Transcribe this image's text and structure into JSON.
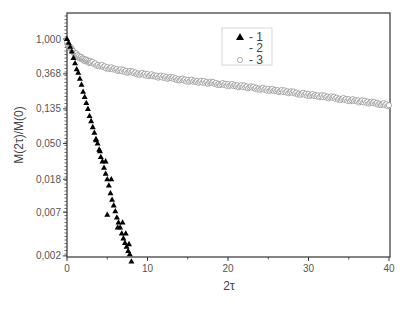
{
  "chart_data": {
    "type": "scatter",
    "title": "",
    "xlabel": "2τ",
    "ylabel": "M(2τ)/M(0)",
    "xlim": [
      0,
      40
    ],
    "ylim": [
      0.0015,
      1.6
    ],
    "yscale": "log",
    "grid": false,
    "legend_position": "upper center",
    "x_ticks": [
      0,
      10,
      20,
      30,
      40
    ],
    "y_ticks": [
      1.0,
      0.368,
      0.135,
      0.05,
      0.018,
      0.007,
      0.002
    ],
    "y_tick_labels": [
      "1,000",
      "0,368",
      "0,135",
      "0,050",
      "0,018",
      "0,007",
      "0,002"
    ],
    "x_tick_labels": [
      "0",
      "10",
      "20",
      "30",
      "40"
    ],
    "legend": [
      {
        "label": "- 1",
        "marker": "filled-triangle"
      },
      {
        "label": "- 2",
        "marker": "none"
      },
      {
        "label": "- 3",
        "marker": "open-circle"
      }
    ],
    "series": [
      {
        "name": "1",
        "marker": "filled-triangle",
        "color": "#000000",
        "x": [
          0.0,
          0.2,
          0.4,
          0.6,
          0.8,
          1.0,
          1.2,
          1.4,
          1.6,
          1.8,
          2.0,
          2.2,
          2.4,
          2.6,
          2.8,
          3.0,
          3.2,
          3.4,
          3.6,
          3.8,
          4.0,
          4.2,
          4.4,
          4.6,
          4.8,
          5.0,
          5.2,
          5.4,
          5.6,
          5.8,
          6.0,
          6.2,
          6.4,
          6.6,
          6.8,
          7.0,
          7.2,
          7.4,
          7.6,
          7.8,
          8.0,
          4.1,
          4.8,
          5.5,
          6.3,
          6.9,
          7.3,
          7.7,
          3.6,
          5.0
        ],
        "values": [
          1.0,
          0.9,
          0.8,
          0.7,
          0.58,
          0.5,
          0.42,
          0.38,
          0.32,
          0.27,
          0.22,
          0.19,
          0.16,
          0.135,
          0.11,
          0.095,
          0.08,
          0.068,
          0.057,
          0.05,
          0.042,
          0.034,
          0.03,
          0.025,
          0.021,
          0.018,
          0.015,
          0.012,
          0.01,
          0.0085,
          0.0072,
          0.006,
          0.0052,
          0.0045,
          0.0038,
          0.0033,
          0.0029,
          0.0026,
          0.0023,
          0.0021,
          0.0017,
          0.04,
          0.03,
          0.018,
          0.0045,
          0.0052,
          0.0038,
          0.0028,
          0.055,
          0.0065
        ]
      },
      {
        "name": "3",
        "marker": "open-circle",
        "color": "#888888",
        "x": [
          0.0,
          0.5,
          1.0,
          1.5,
          2.0,
          2.5,
          3.0,
          4.0,
          5.0,
          6.0,
          7.0,
          8.0,
          9.0,
          10.0,
          11.0,
          12.0,
          13.0,
          14.0,
          15.0,
          16.0,
          17.0,
          18.0,
          19.0,
          20.0,
          21.0,
          22.0,
          23.0,
          24.0,
          25.0,
          26.0,
          27.0,
          28.0,
          29.0,
          30.0,
          31.0,
          32.0,
          33.0,
          34.0,
          35.0,
          36.0,
          37.0,
          38.0,
          39.0,
          40.0
        ],
        "values": [
          0.88,
          0.75,
          0.66,
          0.6,
          0.56,
          0.53,
          0.51,
          0.47,
          0.44,
          0.42,
          0.4,
          0.385,
          0.37,
          0.36,
          0.345,
          0.335,
          0.325,
          0.315,
          0.305,
          0.297,
          0.29,
          0.283,
          0.276,
          0.27,
          0.262,
          0.255,
          0.248,
          0.241,
          0.235,
          0.228,
          0.222,
          0.215,
          0.209,
          0.203,
          0.197,
          0.191,
          0.186,
          0.18,
          0.175,
          0.17,
          0.165,
          0.16,
          0.156,
          0.15
        ]
      }
    ]
  },
  "plot_area": {
    "left": 67,
    "top": 13,
    "right": 390,
    "bottom": 257,
    "y_one_px": 39,
    "px_per_efold": 34.9,
    "px_per_x_unit": 8.05
  }
}
